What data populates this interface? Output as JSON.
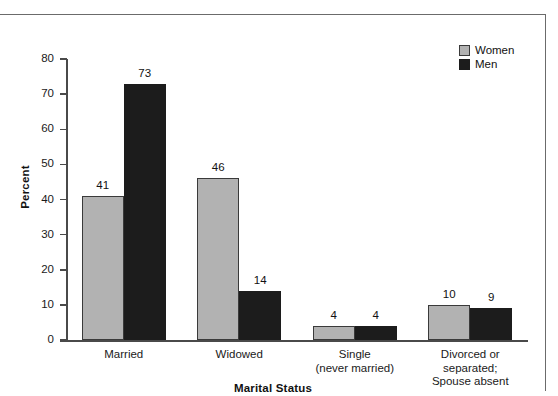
{
  "chart_data": {
    "type": "bar",
    "title": "",
    "xlabel": "Marital Status",
    "ylabel": "Percent",
    "categories": [
      "Married",
      "Widowed",
      "Single\n(never married)",
      "Divorced or\nseparated;\nSpouse absent"
    ],
    "series": [
      {
        "name": "Women",
        "color": "#b2b2b2",
        "values": [
          41,
          46,
          4,
          10
        ]
      },
      {
        "name": "Men",
        "color": "#1c1c1c",
        "values": [
          73,
          14,
          4,
          9
        ]
      }
    ],
    "ylim": [
      0,
      80
    ],
    "yticks": [
      0,
      10,
      20,
      30,
      40,
      50,
      60,
      70,
      80
    ],
    "ytick_labels": [
      "0",
      "10",
      "20",
      "30",
      "40",
      "50",
      "60",
      "70",
      "80"
    ],
    "grid": false,
    "legend_position": "top-right",
    "value_labels": [
      "41",
      "73",
      "46",
      "14",
      "4",
      "4",
      "10",
      "9"
    ]
  },
  "legend": {
    "items": [
      {
        "label": "Women",
        "swatch": "women-swatch"
      },
      {
        "label": "Men",
        "swatch": "men-swatch"
      }
    ]
  },
  "axes": {
    "y_title": "Percent",
    "x_title": "Marital Status"
  }
}
